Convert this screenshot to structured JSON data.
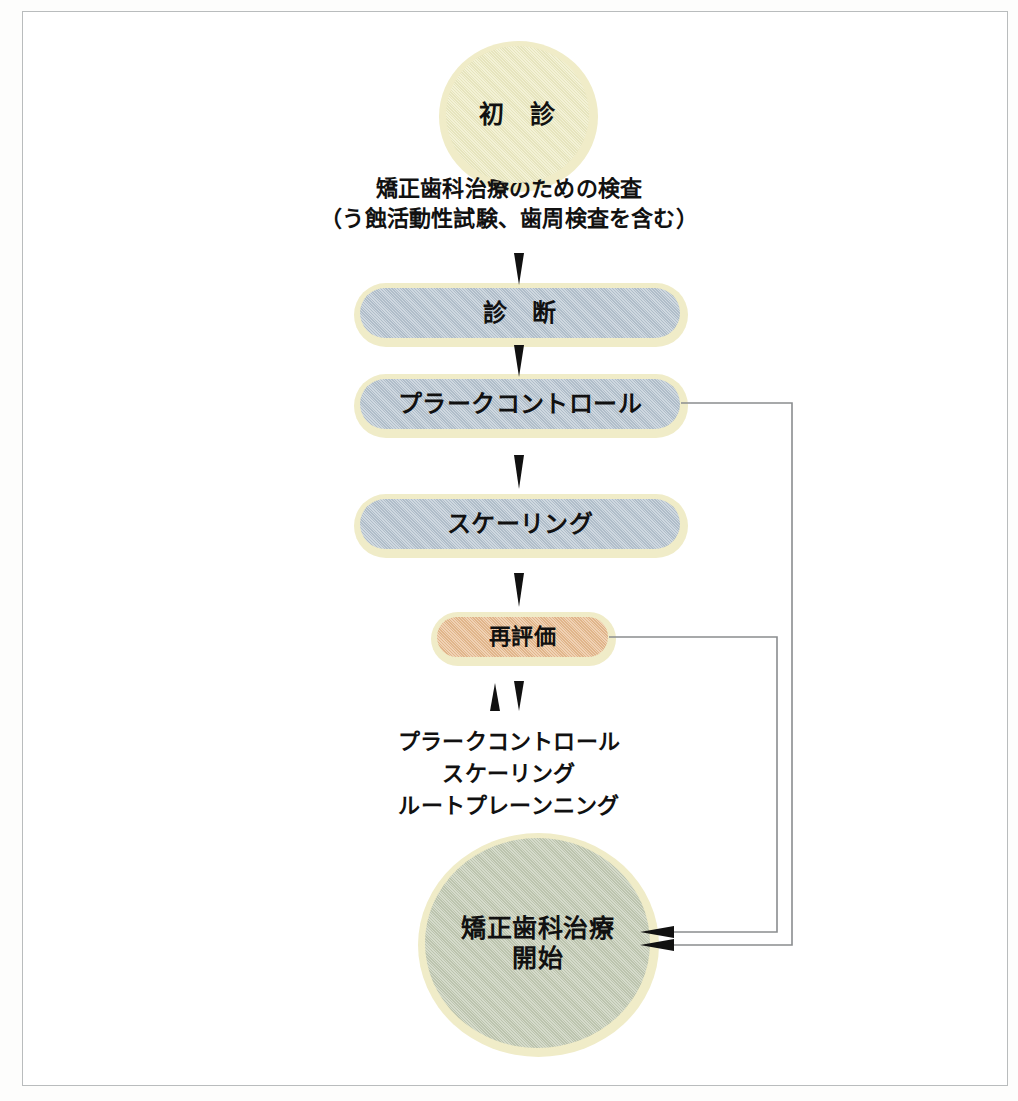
{
  "diagram": {
    "type": "flowchart",
    "nodes": {
      "first_visit": {
        "label": "初　診",
        "shape": "circle",
        "color": "#eeecc4"
      },
      "diagnosis": {
        "label": "診　断",
        "shape": "pill",
        "color": "#b7c5d1"
      },
      "plaque_control": {
        "label": "プラークコントロール",
        "shape": "pill",
        "color": "#b7c5d1"
      },
      "scaling": {
        "label": "スケーリング",
        "shape": "pill",
        "color": "#b7c5d1"
      },
      "reevaluation": {
        "label": "再評価",
        "shape": "pill",
        "color": "#e9bc90"
      },
      "treatment_start": {
        "label": "矯正歯科治療\n開始",
        "shape": "circle",
        "color": "#c3cbb4"
      }
    },
    "captions": {
      "examination": "矯正歯科治療のための検査\n（う蝕活動性試験、歯周検査を含む）",
      "treatments": "プラークコントロール\nスケーリング\nルートプレーンニング"
    },
    "edge_labels": {
      "first_to_diagnosis": "矯正歯科治療のための検査（う蝕活動性試験、歯周検査を含む）",
      "reeval_loop": "プラークコントロール／スケーリング／ルートプレーンニング"
    },
    "palette": {
      "cream": "#eeecc4",
      "halo_cream": "#f0ecc8",
      "blue_gray": "#b7c5d1",
      "peach": "#e9bc90",
      "sage_green": "#c3cbb4",
      "line": "#8a8d8f",
      "frame": "#b9bcbd",
      "text": "#111111",
      "background": "#ffffff"
    }
  },
  "icons": {
    "arrow_down": "arrow-down-icon",
    "arrow_up": "arrow-up-icon",
    "arrowhead_left": "arrowhead-left-icon"
  }
}
